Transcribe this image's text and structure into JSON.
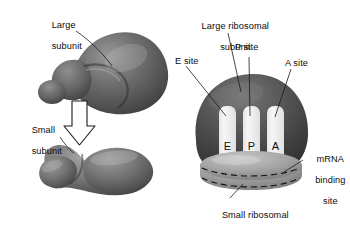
{
  "figure": {
    "title_present": false,
    "background_color": "#ffffff",
    "subunit_fill_dark": "#5d5d5d",
    "subunit_fill_light": "#a9a9a9",
    "slot_fill": "#f2f2f2",
    "line_color": "#111111"
  },
  "left_panel": {
    "labels": {
      "large_subunit_line1": "Large",
      "large_subunit_line2": "subunit",
      "small_subunit_line1": "Small",
      "small_subunit_line2": "subunit"
    },
    "arrow": {
      "name": "assembly-arrow",
      "direction": "down",
      "style": "hollow-outline"
    }
  },
  "right_panel": {
    "labels": {
      "large_ribosomal_line1": "Large ribosomal",
      "large_ribosomal_line2": "subunit",
      "e_site": "E site",
      "p_site": "P site",
      "a_site": "A site",
      "mrna_line1": "mRNA",
      "mrna_line2": "binding",
      "mrna_line3": "site",
      "small_ribosomal_line1": "Small ribosomal",
      "small_ribosomal_line2": "subunit"
    },
    "sites": [
      {
        "letter": "E",
        "name": "e-site-slot"
      },
      {
        "letter": "P",
        "name": "p-site-slot"
      },
      {
        "letter": "A",
        "name": "a-site-slot"
      }
    ]
  }
}
